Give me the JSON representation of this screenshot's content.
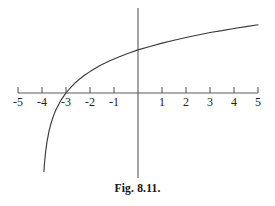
{
  "figure": {
    "caption": "Fig. 8.11.",
    "background_color": "#ffffff",
    "line_color": "#3a3a3a",
    "axis_color": "#5a5a5a",
    "text_color": "#222222"
  },
  "chart_data": {
    "type": "line",
    "title": "",
    "subtitle": "",
    "xlabel": "",
    "ylabel": "",
    "grid": false,
    "legend": null,
    "legend_position": "none",
    "xlim": [
      -5,
      5
    ],
    "ylim": [
      -3.6,
      3.6
    ],
    "x_axis_ticks": [
      -5,
      -4,
      -3,
      -2,
      -1,
      1,
      2,
      3,
      4,
      5
    ],
    "x_tick_labels": [
      "-5",
      "-4",
      "-3",
      "-2",
      "-1",
      "1",
      "2",
      "3",
      "4",
      "5"
    ],
    "y_axis_ticks": [],
    "y_tick_labels": [],
    "annotations": [],
    "series": [
      {
        "name": "y = ln(x + 4)",
        "x_intercept": -3,
        "y_intercept": 1.39,
        "vertical_asymptote": -4,
        "x": [
          -3.92,
          -3.9,
          -3.85,
          -3.8,
          -3.7,
          -3.6,
          -3.5,
          -3.4,
          -3.3,
          -3.2,
          -3.1,
          -3.0,
          -2.8,
          -2.6,
          -2.4,
          -2.2,
          -2.0,
          -1.6,
          -1.2,
          -0.8,
          -0.4,
          0,
          0.5,
          1,
          1.5,
          2,
          2.5,
          3,
          3.5,
          4,
          4.5,
          5
        ],
        "y": [
          -2.53,
          -2.3,
          -1.9,
          -1.61,
          -1.2,
          -0.92,
          -0.69,
          -0.51,
          -0.36,
          -0.22,
          -0.11,
          0,
          0.18,
          0.34,
          0.47,
          0.59,
          0.69,
          0.88,
          1.03,
          1.16,
          1.28,
          1.39,
          1.5,
          1.61,
          1.7,
          1.79,
          1.87,
          1.95,
          2.01,
          2.08,
          2.14,
          2.2
        ]
      }
    ]
  }
}
